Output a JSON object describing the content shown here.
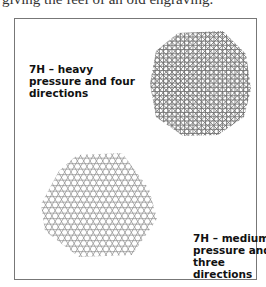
{
  "caption_top": "giving the feel of an old engraving.",
  "figure": {
    "samples": [
      {
        "label_line1": "7H – heavy",
        "label_line2": "pressure and four",
        "label_line3": "directions",
        "directions": 4,
        "pressure": "heavy"
      },
      {
        "label_line1": "7H – medium",
        "label_line2": "pressure and",
        "label_line3": "three directions",
        "directions": 3,
        "pressure": "medium"
      }
    ]
  },
  "colors": {
    "border": "#777777",
    "stroke_heavy": "#555555",
    "stroke_medium": "#777777",
    "text": "#111111"
  }
}
